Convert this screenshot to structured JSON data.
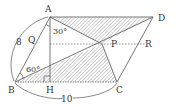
{
  "figure": {
    "type": "geometry-diagram",
    "points": {
      "A": {
        "label": "A",
        "x": 50,
        "y": 17
      },
      "B": {
        "label": "B",
        "x": 15,
        "y": 82
      },
      "C": {
        "label": "C",
        "x": 117,
        "y": 82
      },
      "D": {
        "label": "D",
        "x": 153,
        "y": 17
      },
      "H": {
        "label": "H",
        "x": 50,
        "y": 82
      },
      "P": {
        "label": "P",
        "x": 102,
        "y": 44
      },
      "Q": {
        "label": "Q"
      },
      "R": {
        "label": "R"
      }
    },
    "measurements": {
      "AB": "8",
      "BC": "10"
    },
    "angles": {
      "at_A": "30°",
      "at_B": "60°"
    },
    "shaded_regions": [
      "triangle ADP",
      "triangle BPC"
    ],
    "dashed_lines": [
      "horizontal line through P",
      "segment BC"
    ],
    "colors": {
      "stroke": "#555555",
      "hatch": "#888888",
      "text": "#333333"
    }
  }
}
